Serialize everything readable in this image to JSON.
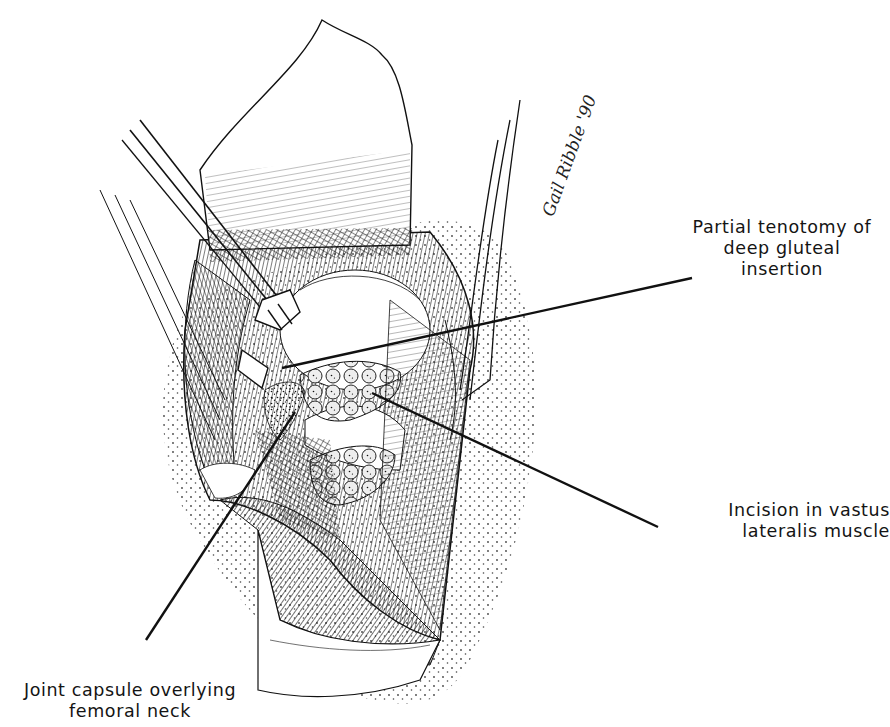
{
  "figure": {
    "type": "surgical-illustration",
    "style": "pen-and-ink stipple and hatching",
    "colors": {
      "ink": "#141414",
      "background": "#ffffff"
    }
  },
  "labels": {
    "tenotomy": {
      "lines": [
        "Partial tenotomy of",
        "deep gluteal",
        "insertion"
      ],
      "leader_from": [
        692,
        278
      ],
      "leader_to": [
        282,
        368
      ]
    },
    "incision": {
      "lines": [
        "Incision in vastus",
        "lateralis muscle"
      ],
      "leader_from": [
        658,
        527
      ],
      "leader_to": [
        372,
        393
      ]
    },
    "capsule": {
      "lines": [
        "Joint capsule overlying",
        "femoral neck"
      ],
      "leader_from": [
        146,
        640
      ],
      "leader_to": [
        295,
        412
      ]
    }
  },
  "signature": {
    "text": "Gail Ribble '90"
  }
}
